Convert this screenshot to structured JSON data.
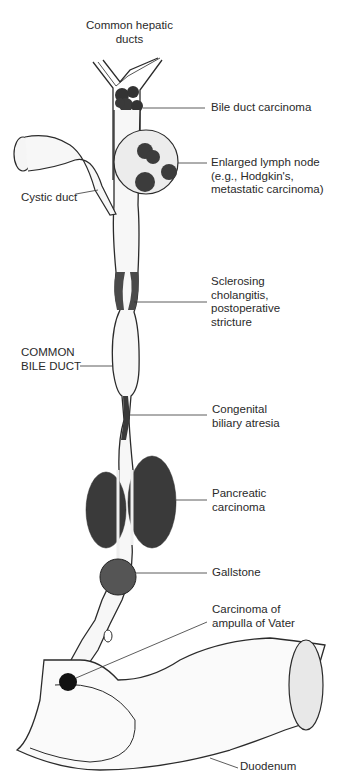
{
  "figure": {
    "labels": {
      "common_hepatic_ducts": [
        "Common hepatic",
        "ducts"
      ],
      "bile_duct_carcinoma": "Bile duct carcinoma",
      "enlarged_lymph_node": [
        "Enlarged lymph node",
        "(e.g., Hodgkin's,",
        "metastatic carcinoma)"
      ],
      "cystic_duct": "Cystic duct",
      "sclerosing_cholangitis": [
        "Sclerosing",
        "cholangitis,",
        "postoperative",
        "stricture"
      ],
      "common_bile_duct": [
        "COMMON",
        "BILE DUCT"
      ],
      "congenital_biliary_atresia": [
        "Congenital",
        "biliary atresia"
      ],
      "pancreatic_carcinoma": [
        "Pancreatic",
        "carcinoma"
      ],
      "gallstone": "Gallstone",
      "carcinoma_ampulla": [
        "Carcinoma of",
        "ampulla of Vater"
      ],
      "duodenum": "Duodenum"
    },
    "colors": {
      "line": "#2b2b2b",
      "lesion_dark": "#3a3a3a",
      "lesion_mid": "#5a5a5a",
      "lymph_fill": "#ededed",
      "duct_fill": "#f7f7f7"
    }
  }
}
